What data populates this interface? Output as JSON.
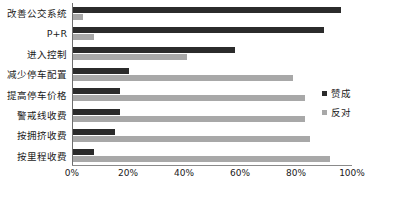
{
  "chart_data": {
    "type": "bar",
    "orientation": "horizontal",
    "title": "",
    "subtitle": "",
    "xlabel": "",
    "ylabel": "",
    "xlim": [
      0,
      100
    ],
    "xtick_labels": [
      "0%",
      "20%",
      "40%",
      "60%",
      "80%",
      "100%"
    ],
    "xtick_values": [
      0,
      20,
      40,
      60,
      80,
      100
    ],
    "grid": false,
    "legend_position": "right",
    "categories": [
      "改善公交系统",
      "P+R",
      "进入控制",
      "减少停车配置",
      "提高停车价格",
      "警戒线收费",
      "按拥挤收费",
      "按里程收费"
    ],
    "series": [
      {
        "name": "赞成",
        "color": "#2b2b2b",
        "values": [
          96,
          90,
          58,
          20,
          17,
          17,
          15,
          7.5
        ]
      },
      {
        "name": "反对",
        "color": "#a8a8a8",
        "values": [
          3.5,
          7.5,
          41,
          79,
          83,
          83,
          85,
          92
        ]
      }
    ]
  },
  "legend": {
    "entries": [
      {
        "label": "赞成",
        "color": "#2b2b2b"
      },
      {
        "label": "反对",
        "color": "#a8a8a8"
      }
    ]
  }
}
